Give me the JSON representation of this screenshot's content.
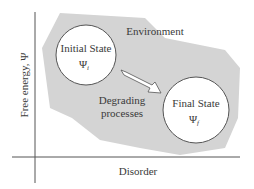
{
  "diagram": {
    "environment_label": "Environment",
    "initial_state": {
      "title": "Initial State",
      "symbol": "Ψ",
      "subscript": "i"
    },
    "final_state": {
      "title": "Final State",
      "symbol": "Ψ",
      "subscript": "f"
    },
    "process_label_line1": "Degrading",
    "process_label_line2": "processes",
    "y_axis_label": "Free energy, Ψ",
    "x_axis_label": "Disorder"
  },
  "colors": {
    "environment_fill": "#d4d4d4",
    "axis": "#444444",
    "circle_stroke": "#555555",
    "circle_fill": "#ffffff",
    "text": "#3a3a3a"
  }
}
